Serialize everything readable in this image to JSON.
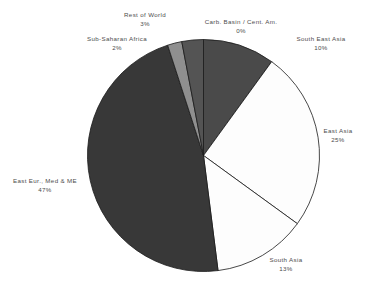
{
  "chart_data": {
    "type": "pie",
    "title": "",
    "subtitle": "",
    "xlabel": "",
    "ylabel": "",
    "legend_position": "none",
    "grid": false,
    "start_angle_deg": 0,
    "direction": "clockwise",
    "categories": [
      "South East Asia",
      "East Asia",
      "South Asia",
      "East Eur., Med & ME",
      "Sub-Saharan Africa",
      "Rest of World",
      "Carb. Basin / Cent. Am."
    ],
    "values": [
      10,
      25,
      13,
      47,
      2,
      3,
      0
    ],
    "value_labels": [
      "10%",
      "25%",
      "13%",
      "47%",
      "2%",
      "3%",
      "0%"
    ],
    "slice_colors": [
      "#4a4a4a",
      "#fdfdfd",
      "#fdfdfd",
      "#383838",
      "#8f8f8f",
      "#545454",
      "#6e6e6e"
    ],
    "slice_stroke": "#1a1a1a",
    "background": "#ffffff",
    "text_color": "#4d4d4d",
    "slices": [
      {
        "label": "South East Asia",
        "value": 10,
        "value_label": "10%",
        "color": "#4a4a4a"
      },
      {
        "label": "East Asia",
        "value": 25,
        "value_label": "25%",
        "color": "#fdfdfd"
      },
      {
        "label": "South Asia",
        "value": 13,
        "value_label": "13%",
        "color": "#fdfdfd"
      },
      {
        "label": "East Eur., Med & ME",
        "value": 47,
        "value_label": "47%",
        "color": "#383838"
      },
      {
        "label": "Sub-Saharan Africa",
        "value": 2,
        "value_label": "2%",
        "color": "#8f8f8f"
      },
      {
        "label": "Rest of World",
        "value": 3,
        "value_label": "3%",
        "color": "#545454"
      },
      {
        "label": "Carb. Basin / Cent. Am.",
        "value": 0,
        "value_label": "0%",
        "color": "#6e6e6e"
      }
    ]
  },
  "labels": {
    "rest_of_world": {
      "name": "Rest of World",
      "pct": "3%"
    },
    "carb_basin": {
      "name": "Carb. Basin / Cent. Am.",
      "pct": "0%"
    },
    "sub_saharan": {
      "name": "Sub-Saharan  Africa",
      "pct": "2%"
    },
    "south_east_asia": {
      "name": "South East Asia",
      "pct": "10%"
    },
    "east_asia": {
      "name": "East  Asia",
      "pct": "25%"
    },
    "south_asia": {
      "name": "South  Asia",
      "pct": "13%"
    },
    "east_eur": {
      "name": "East Eur., Med & ME",
      "pct": "47%"
    }
  }
}
